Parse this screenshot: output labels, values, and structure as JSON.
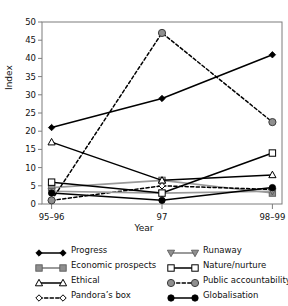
{
  "chart_data": {
    "type": "line",
    "title": "",
    "xlabel": "Year",
    "ylabel": "Index",
    "categories": [
      "95–96",
      "97",
      "98–99"
    ],
    "ylim": [
      0,
      50
    ],
    "yticks": [
      0,
      5,
      10,
      15,
      20,
      25,
      30,
      35,
      40,
      45,
      50
    ],
    "grid": false,
    "legend_position": "bottom",
    "series": [
      {
        "name": "Progress",
        "values": [
          21,
          29,
          41
        ],
        "marker": "filled-diamond",
        "line": "solid",
        "color": "#000000"
      },
      {
        "name": "Economic prospects",
        "values": [
          4.5,
          6.5,
          3
        ],
        "marker": "gray-square",
        "line": "solid",
        "color": "#9a9a9a"
      },
      {
        "name": "Ethical",
        "values": [
          17,
          6.5,
          8
        ],
        "marker": "open-triangle",
        "line": "solid",
        "color": "#000000"
      },
      {
        "name": "Pandora’s box",
        "values": [
          1,
          5,
          4
        ],
        "marker": "open-diamond",
        "line": "dashed",
        "color": "#000000"
      },
      {
        "name": "Runaway",
        "values": [
          3.5,
          3,
          3.5
        ],
        "marker": "gray-down-triangle",
        "line": "solid",
        "color": "#9a9a9a"
      },
      {
        "name": "Nature/nurture",
        "values": [
          6,
          3,
          14
        ],
        "marker": "open-square",
        "line": "solid",
        "color": "#000000"
      },
      {
        "name": "Public accountability",
        "values": [
          1,
          47,
          22.5
        ],
        "marker": "gray-circle",
        "line": "dashed",
        "color": "#000000"
      },
      {
        "name": "Globalisation",
        "values": [
          3,
          1,
          4.5
        ],
        "marker": "filled-circle",
        "line": "solid",
        "color": "#000000"
      }
    ]
  },
  "axes": {
    "ylabel": "Index",
    "xlabel": "Year",
    "ytick_labels": [
      "0",
      "5",
      "10",
      "15",
      "20",
      "25",
      "30",
      "35",
      "40",
      "45",
      "50"
    ],
    "xtick_labels": [
      "95–96",
      "97",
      "98–99"
    ]
  },
  "legend": {
    "left_column": [
      {
        "label": "Progress"
      },
      {
        "label": "Economic prospects"
      },
      {
        "label": "Ethical"
      },
      {
        "label": "Pandora’s box"
      }
    ],
    "right_column": [
      {
        "label": "Runaway"
      },
      {
        "label": "Nature/nurture"
      },
      {
        "label": "Public accountability"
      },
      {
        "label": "Globalisation"
      }
    ]
  }
}
